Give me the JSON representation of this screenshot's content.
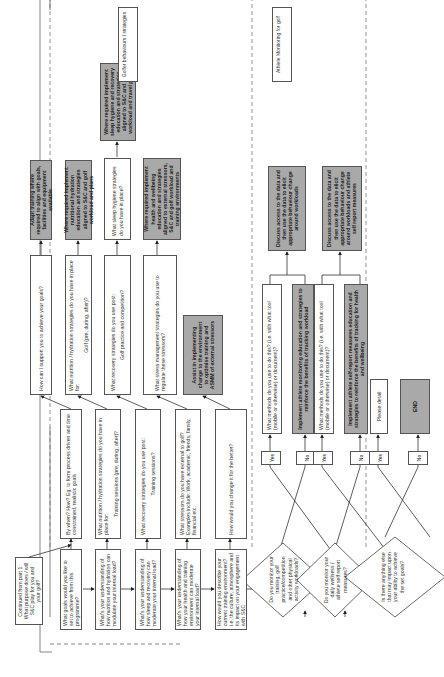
{
  "headers": {
    "left": "Golfer behaviours / strategies",
    "right": "Athlete Monitoring for golf"
  },
  "start": {
    "text": "Continued from part 1: What purpose does / will S&C play for you and your golf?"
  },
  "rows": [
    {
      "col1": "What goals would you like to set to achieve from this programme?",
      "col2": "By when? How? Eg. to form process driven and time constrained, realistic goals",
      "col3": "How can I support you to achieve your goals?",
      "col4": "Adapt training where required to align with goals, facilities and equipment available"
    },
    {
      "col1": "What's your understanding of how nutrition and hydration can modulate your internal load?",
      "col2": "What nutrition / hydration strategies do you have in place for:",
      "col2_sub": "Training sessions (pre, during, after)?",
      "col3": "What nutrition / hydration strategies do you have in place for:",
      "col3_sub": "Golf (pre, during, after)?",
      "col4": "Where required implement nutritional hydration education and strategies aligned to S&C and golf workload and plans"
    },
    {
      "col1": "What's your understanding of how sleep and recovery can moderate your internal load?",
      "col2": "What recovery strategies do you use post:",
      "col2_sub": "Training sessions?",
      "col3": "What recovery strategies do you use post:",
      "col3_sub": "Golf practice and competition?",
      "col4": "What sleep hygiene strategies do you have in place?",
      "col5": "Where required implement sleep hygiene and recovery education and strategies aligned to S&C and golf workload and travel plans"
    },
    {
      "col1": "What's your understanding of how your health and training environment can moderate your internal load?",
      "col2": "What stressors do you have external to golf?",
      "col2_sub": "Examples include: Work, academic, friends, family, financial etc.",
      "col3": "What stress management strategies do you use to regulate these stressors?",
      "col4": "Where required implement health and wellbeing education and strategies aligned to external stressors, S&C and golf workload and training environments"
    },
    {
      "col1": "How would you describe your current training environment? i.e. the culture, atmosphere and its impact on your engagement with S&C",
      "col2": "How would you change it for the better?",
      "col3": "Assist in implementing change to the environment to optimise training and ASMM of external stressors"
    }
  ],
  "decisions": [
    {
      "question": "Do you monitor your training, golf practice/competition and other physical activity workloads?",
      "yes_label": "Yes",
      "no_label": "No",
      "yes_box": "What methods do you use to do this? (i.e. with what tool (mobile or otherwise) or document)?",
      "no_box": "Implement athlete monitoring education and strategies to reinforce the benefits of tracking workload",
      "outcome": "Discuss access to the data and then use the data to elicit appropriate behaviour change around workloads"
    },
    {
      "question": "Do you monitor your daily wellness / athlete self report measures?",
      "yes_label": "Yes",
      "no_label": "No",
      "yes_box": "What methods do you use to do this? (i.e. with what tool (mobile or otherwise) or document)?",
      "no_box": "Implement athlete self-report measures education and strategies to reinforce the benefits of tracking for health and wellbeing",
      "outcome": "Discuss access to the data and then use the data to elicit appropriate behaviour change around workloads and athlete self report measures"
    },
    {
      "question": "Is there anything else that may impact upon your ability to achieve the set goals?",
      "yes_label": "Yes",
      "no_label": "No",
      "yes_box": "Please detail",
      "no_box": "END"
    }
  ]
}
